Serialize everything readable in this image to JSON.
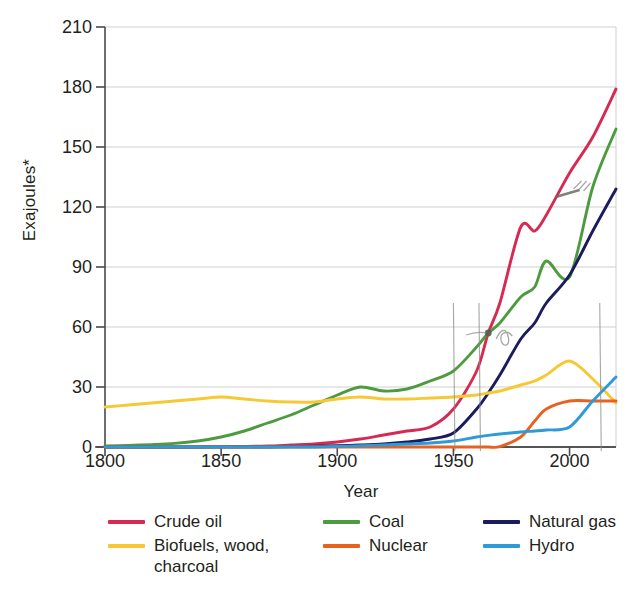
{
  "chart_data": {
    "type": "line",
    "title": "",
    "xlabel": "Year",
    "ylabel": "Exajoules*",
    "xlim": [
      1800,
      2020
    ],
    "ylim": [
      0,
      210
    ],
    "xticks": [
      1800,
      1850,
      1900,
      1950,
      2000
    ],
    "yticks": [
      0,
      30,
      60,
      90,
      120,
      150,
      180,
      210
    ],
    "grid": "horizontal",
    "legend_position": "below",
    "x": [
      1800,
      1810,
      1820,
      1830,
      1840,
      1850,
      1860,
      1870,
      1880,
      1890,
      1900,
      1910,
      1920,
      1930,
      1940,
      1950,
      1960,
      1965,
      1970,
      1979,
      1985,
      1990,
      2000,
      2010,
      2020
    ],
    "series": [
      {
        "name": "Crude oil",
        "color": "#d62a52",
        "values": [
          0,
          0,
          0,
          0,
          0,
          0.2,
          0.3,
          0.5,
          1,
          1.5,
          2.5,
          4,
          6,
          8,
          10,
          19,
          38,
          57,
          72,
          110,
          108,
          116,
          137,
          155,
          179
        ]
      },
      {
        "name": "Coal",
        "color": "#4d9b3f",
        "values": [
          0.5,
          0.8,
          1.2,
          1.8,
          3,
          5,
          8,
          12,
          16,
          21,
          26,
          30,
          28,
          29,
          33,
          38,
          50,
          57,
          62,
          75,
          80,
          93,
          85,
          130,
          159
        ]
      },
      {
        "name": "Natural gas",
        "color": "#1b1b5e",
        "values": [
          0,
          0,
          0,
          0,
          0,
          0,
          0,
          0,
          0.2,
          0.4,
          0.7,
          1,
          1.5,
          2.5,
          4,
          7,
          19,
          27,
          36,
          54,
          62,
          72,
          86,
          108,
          129
        ]
      },
      {
        "name": "Biofuels, wood, charcoal",
        "color": "#f6c833",
        "values": [
          20,
          21,
          22,
          23,
          24,
          25,
          24,
          23,
          22.5,
          22.5,
          24,
          25,
          24,
          24,
          24.5,
          25,
          26,
          27,
          28,
          31,
          33,
          36,
          43,
          34,
          22
        ]
      },
      {
        "name": "Nuclear",
        "color": "#e8611f",
        "values": [
          0,
          0,
          0,
          0,
          0,
          0,
          0,
          0,
          0,
          0,
          0,
          0,
          0,
          0,
          0,
          0,
          0,
          0,
          0.2,
          5,
          13,
          19,
          23,
          23,
          23
        ]
      },
      {
        "name": "Hydro",
        "color": "#2e9bd8",
        "values": [
          0,
          0,
          0,
          0,
          0,
          0,
          0,
          0,
          0,
          0,
          0.3,
          0.6,
          1,
          1.5,
          2,
          3,
          5,
          5.8,
          6.5,
          7.5,
          8,
          8.5,
          10,
          23,
          35
        ]
      }
    ],
    "annotations": [
      {
        "kind": "pencil-dot",
        "x": 1965,
        "y": 57,
        "note": "marked crossing of crude oil and coal"
      },
      {
        "kind": "pencil-tick",
        "x": 2000,
        "y": 127,
        "note": "marked point on crude oil line"
      },
      {
        "kind": "pencil-vertical",
        "x": 1950,
        "note": "hand-drawn vertical line"
      },
      {
        "kind": "pencil-vertical",
        "x": 1961,
        "note": "hand-drawn vertical line"
      },
      {
        "kind": "pencil-vertical",
        "x": 2013,
        "note": "hand-drawn vertical line"
      }
    ]
  },
  "axes": {
    "ylabel": "Exajoules*",
    "xlabel": "Year",
    "yticks": [
      "0",
      "30",
      "60",
      "90",
      "120",
      "150",
      "180",
      "210"
    ],
    "xticks": [
      "1800",
      "1850",
      "1900",
      "1950",
      "2000"
    ]
  },
  "legend": {
    "entries": [
      {
        "label": "Crude oil",
        "color": "#d62a52"
      },
      {
        "label": "Coal",
        "color": "#4d9b3f"
      },
      {
        "label": "Natural gas",
        "color": "#1b1b5e"
      },
      {
        "label": "Biofuels, wood, charcoal",
        "color": "#f6c833"
      },
      {
        "label": "Nuclear",
        "color": "#e8611f"
      },
      {
        "label": "Hydro",
        "color": "#2e9bd8"
      }
    ]
  },
  "colors": {
    "background": "#ffffff",
    "text": "#231f20",
    "grid": "#c9c9c9",
    "axis": "#4a4a4a",
    "pencil": "#8a8a86"
  }
}
